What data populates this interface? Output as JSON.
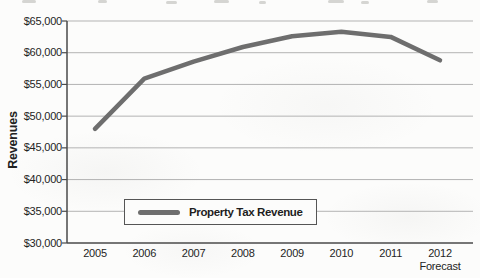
{
  "chart_data": {
    "type": "line",
    "title": "",
    "xlabel": "",
    "ylabel": "Revenues",
    "categories": [
      "2005",
      "2006",
      "2007",
      "2008",
      "2009",
      "2010",
      "2011",
      "2012"
    ],
    "last_category_sublabel": "Forecast",
    "series": [
      {
        "name": "Property Tax Revenue",
        "color": "#6e6e6e",
        "values": [
          48000,
          55900,
          58600,
          60900,
          62600,
          63300,
          62500,
          58800
        ]
      }
    ],
    "ylim": [
      30000,
      65000
    ],
    "ytick_step": 5000,
    "ytick_labels_top_to_bottom": [
      "$65,000",
      "$60,000",
      "$55,000",
      "$50,000",
      "$45,000",
      "$40,000",
      "$35,000",
      "$30,000"
    ],
    "grid": true,
    "legend": {
      "label": "Property Tax Revenue",
      "position": "inside-bottom-left"
    }
  },
  "colors": {
    "line": "#6e6e6e",
    "gridline": "#b3b3b3",
    "axis": "#4a4a4a",
    "text": "#242424",
    "background": "#fcfcfb"
  }
}
